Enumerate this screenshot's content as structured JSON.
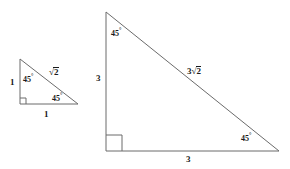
{
  "figure": {
    "stroke_color": "#6b6b6b",
    "text_color": "#1a1a1a",
    "background_color": "#ffffff"
  },
  "small_triangle": {
    "name": "small-45-45-90-triangle",
    "leg_left_label": "1",
    "base_label": "1",
    "hypotenuse_radicand": "2",
    "hypotenuse_coefficient": "",
    "angle_top_value": "45",
    "angle_top_degree": "°",
    "angle_right_value": "45",
    "angle_right_degree": "°",
    "radical_sign": "√",
    "vertices": {
      "top": [
        20,
        59
      ],
      "bottom_left": [
        20,
        104
      ],
      "bottom_right": [
        78,
        104
      ]
    }
  },
  "large_triangle": {
    "name": "large-45-45-90-triangle",
    "leg_left_label": "3",
    "base_label": "3",
    "hypotenuse_radicand": "2",
    "hypotenuse_coefficient": "3",
    "angle_top_value": "45",
    "angle_top_degree": "°",
    "angle_right_value": "45",
    "angle_right_degree": "°",
    "radical_sign": "√",
    "vertices": {
      "top": [
        106,
        12
      ],
      "bottom_left": [
        106,
        151
      ],
      "bottom_right": [
        279,
        151
      ]
    }
  }
}
